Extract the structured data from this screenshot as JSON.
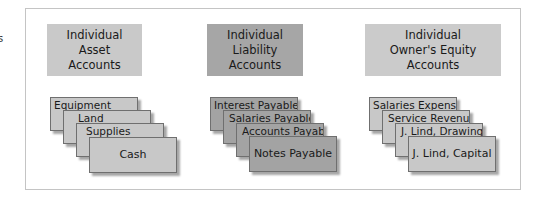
{
  "edge_fragment": "s",
  "groups": [
    {
      "header": "Individual\nAsset\nAccounts",
      "color": "#c9c9c9",
      "cards": [
        "Equipment",
        "Land",
        "Supplies",
        "Cash"
      ]
    },
    {
      "header": "Individual\nLiability\nAccounts",
      "color": "#a6a6a6",
      "cards": [
        "Interest Payable",
        "Salaries Payable",
        "Accounts Payable",
        "Notes Payable"
      ]
    },
    {
      "header": "Individual\nOwner's Equity\nAccounts",
      "color": "#cbcbcb",
      "cards": [
        "Salaries Expense",
        "Service Revenue",
        "J. Lind, Drawing",
        "J. Lind, Capital"
      ]
    }
  ]
}
